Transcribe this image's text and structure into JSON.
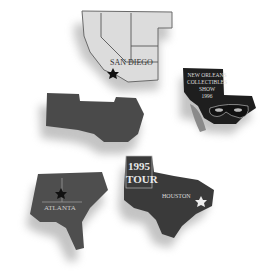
{
  "scene": {
    "description": "Five state-shaped collectible lapel pins on white background",
    "background": "#ffffff"
  },
  "pins": [
    {
      "id": "southwest",
      "label": "SAN DIEGO",
      "fill": "#d9d9d9",
      "outline": "#555555",
      "icon": "star-icon"
    },
    {
      "id": "new-orleans",
      "lines": [
        "NEW ORLEANS",
        "COLLECTIBLES",
        "SHOW",
        "1996"
      ],
      "fill": "#1e1e1e",
      "icon": "mask-icon"
    },
    {
      "id": "midwest",
      "label": "",
      "fill": "#4a4a4a"
    },
    {
      "id": "atlanta",
      "label": "ATLANTA",
      "fill": "#4e4e4e",
      "icon": "star-icon"
    },
    {
      "id": "houston",
      "title_lines": [
        "1995",
        "TOUR"
      ],
      "label": "HOUSTON",
      "fill": "#3a3a3a",
      "icon": "star-icon"
    }
  ]
}
